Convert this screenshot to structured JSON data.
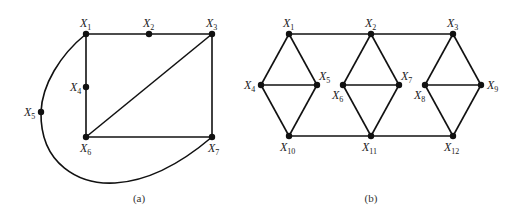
{
  "figures": [
    {
      "id": "a",
      "caption": "(a)",
      "caption_pos": [
        139,
        202
      ],
      "nodes": [
        {
          "name": "X",
          "sub": "1",
          "x": 86,
          "y": 34,
          "lx": 80,
          "ly": 27,
          "anchor": "start"
        },
        {
          "name": "X",
          "sub": "2",
          "x": 149,
          "y": 34,
          "lx": 143,
          "ly": 27,
          "anchor": "start"
        },
        {
          "name": "X",
          "sub": "3",
          "x": 212,
          "y": 34,
          "lx": 206,
          "ly": 27,
          "anchor": "start"
        },
        {
          "name": "X",
          "sub": "4",
          "x": 86,
          "y": 87,
          "lx": 70,
          "ly": 91,
          "anchor": "start"
        },
        {
          "name": "X",
          "sub": "5",
          "x": 41,
          "y": 112,
          "lx": 24,
          "ly": 116,
          "anchor": "start"
        },
        {
          "name": "X",
          "sub": "6",
          "x": 86,
          "y": 137,
          "lx": 80,
          "ly": 152,
          "anchor": "start"
        },
        {
          "name": "X",
          "sub": "7",
          "x": 212,
          "y": 137,
          "lx": 208,
          "ly": 152,
          "anchor": "start"
        }
      ],
      "edges": [
        [
          0,
          1
        ],
        [
          1,
          2
        ],
        [
          0,
          3
        ],
        [
          3,
          5
        ],
        [
          2,
          6
        ],
        [
          5,
          6
        ],
        [
          2,
          5
        ]
      ],
      "curves": [
        "M 86 34 C 60 55, 42 85, 41 112",
        "M 41 112 C 40 165, 80 185, 115 183 C 150 181, 185 160, 212 137"
      ]
    },
    {
      "id": "b",
      "caption": "(b)",
      "caption_pos": [
        371,
        202
      ],
      "nodes": [
        {
          "name": "X",
          "sub": "1",
          "x": 289,
          "y": 34,
          "lx": 283,
          "ly": 27,
          "anchor": "start"
        },
        {
          "name": "X",
          "sub": "2",
          "x": 371,
          "y": 34,
          "lx": 365,
          "ly": 27,
          "anchor": "start"
        },
        {
          "name": "X",
          "sub": "3",
          "x": 453,
          "y": 34,
          "lx": 447,
          "ly": 27,
          "anchor": "start"
        },
        {
          "name": "X",
          "sub": "4",
          "x": 261,
          "y": 85,
          "lx": 244,
          "ly": 89,
          "anchor": "start"
        },
        {
          "name": "X",
          "sub": "5",
          "x": 317,
          "y": 85,
          "lx": 319,
          "ly": 80,
          "anchor": "start"
        },
        {
          "name": "X",
          "sub": "6",
          "x": 343,
          "y": 85,
          "lx": 332,
          "ly": 99,
          "anchor": "start"
        },
        {
          "name": "X",
          "sub": "7",
          "x": 399,
          "y": 85,
          "lx": 401,
          "ly": 80,
          "anchor": "start"
        },
        {
          "name": "X",
          "sub": "8",
          "x": 425,
          "y": 85,
          "lx": 414,
          "ly": 99,
          "anchor": "start"
        },
        {
          "name": "X",
          "sub": "9",
          "x": 481,
          "y": 85,
          "lx": 487,
          "ly": 89,
          "anchor": "start"
        },
        {
          "name": "X",
          "sub": "10",
          "x": 289,
          "y": 136,
          "lx": 280,
          "ly": 151,
          "anchor": "start"
        },
        {
          "name": "X",
          "sub": "11",
          "x": 371,
          "y": 136,
          "lx": 362,
          "ly": 151,
          "anchor": "start"
        },
        {
          "name": "X",
          "sub": "12",
          "x": 453,
          "y": 136,
          "lx": 444,
          "ly": 151,
          "anchor": "start"
        }
      ],
      "edges": [
        [
          0,
          1
        ],
        [
          1,
          2
        ],
        [
          9,
          10
        ],
        [
          10,
          11
        ],
        [
          0,
          3
        ],
        [
          0,
          4
        ],
        [
          3,
          4
        ],
        [
          3,
          9
        ],
        [
          4,
          9
        ],
        [
          1,
          5
        ],
        [
          1,
          6
        ],
        [
          5,
          6
        ],
        [
          5,
          10
        ],
        [
          6,
          10
        ],
        [
          2,
          7
        ],
        [
          2,
          8
        ],
        [
          7,
          8
        ],
        [
          7,
          11
        ],
        [
          8,
          11
        ]
      ],
      "curves": []
    }
  ]
}
